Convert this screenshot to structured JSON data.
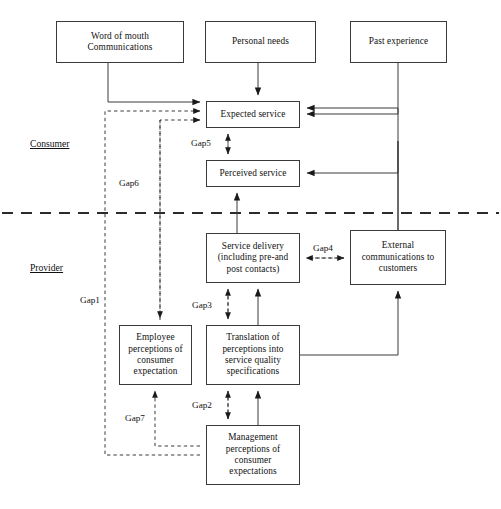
{
  "diagram": {
    "width": 501,
    "height": 509,
    "line_color": "#3a3a3a",
    "background": "#ffffff"
  },
  "zones": [
    {
      "id": "consumer",
      "label": "Consumer",
      "x": 30,
      "y": 138
    },
    {
      "id": "provider",
      "label": "Provider",
      "x": 30,
      "y": 262
    }
  ],
  "divider": {
    "name": "consumer-provider-divider",
    "style": "dashed",
    "y": 213,
    "x1": 2,
    "x2": 499
  },
  "nodes": [
    {
      "id": "word-of-mouth",
      "label": "Word of mouth\nCommunications",
      "x": 56,
      "y": 21,
      "w": 128,
      "h": 42
    },
    {
      "id": "personal-needs",
      "label": "Personal needs",
      "x": 205,
      "y": 21,
      "w": 111,
      "h": 42
    },
    {
      "id": "past-experience",
      "label": "Past experience",
      "x": 350,
      "y": 21,
      "w": 97,
      "h": 42
    },
    {
      "id": "expected-service",
      "label": "Expected service",
      "x": 206,
      "y": 101,
      "w": 94,
      "h": 27
    },
    {
      "id": "perceived-service",
      "label": "Perceived service",
      "x": 206,
      "y": 160,
      "w": 94,
      "h": 27
    },
    {
      "id": "service-delivery",
      "label": "Service delivery\n(including pre-and\npost contacts)",
      "x": 206,
      "y": 233,
      "w": 94,
      "h": 50
    },
    {
      "id": "external-communications",
      "label": "External\ncommunications to\ncustomers",
      "x": 350,
      "y": 230,
      "w": 96,
      "h": 55
    },
    {
      "id": "employee-perceptions",
      "label": "Employee\nperceptions of\nconsumer\nexpectation",
      "x": 119,
      "y": 325,
      "w": 73,
      "h": 60
    },
    {
      "id": "translation-of-perceptions",
      "label": "Translation of\nperceptions into\nservice quality\nspecifications",
      "x": 206,
      "y": 325,
      "w": 94,
      "h": 60
    },
    {
      "id": "management-perceptions",
      "label": "Management\nperceptions of\nconsumer\nexpectations",
      "x": 206,
      "y": 425,
      "w": 94,
      "h": 60
    }
  ],
  "gaps": [
    {
      "id": "gap1",
      "label": "Gap1",
      "x": 79,
      "y": 295
    },
    {
      "id": "gap2",
      "label": "Gap2",
      "x": 191,
      "y": 400
    },
    {
      "id": "gap3",
      "label": "Gap3",
      "x": 191,
      "y": 300
    },
    {
      "id": "gap4",
      "label": "Gap4",
      "x": 312,
      "y": 243
    },
    {
      "id": "gap5",
      "label": "Gap5",
      "x": 190,
      "y": 138
    },
    {
      "id": "gap6",
      "label": "Gap6",
      "x": 118,
      "y": 178
    },
    {
      "id": "gap7",
      "label": "Gap7",
      "x": 124,
      "y": 413
    }
  ],
  "connections": [
    {
      "id": "word-of-mouth-to-expected",
      "style": "solid",
      "from": "word-of-mouth",
      "to": "expected-service"
    },
    {
      "id": "personal-needs-to-expected",
      "style": "solid",
      "from": "personal-needs",
      "to": "expected-service"
    },
    {
      "id": "past-experience-to-expected",
      "style": "solid",
      "from": "past-experience",
      "to": "expected-service"
    },
    {
      "id": "gap1-to-expected",
      "style": "dashed",
      "from": "management-perceptions",
      "to": "expected-service"
    },
    {
      "id": "gap6-to-expected",
      "style": "dashed",
      "from": "employee-perceptions",
      "to": "expected-service"
    },
    {
      "id": "gap5-expected-perceived",
      "style": "dashed",
      "from": "expected-service",
      "to": "perceived-service"
    },
    {
      "id": "service-delivery-to-perceived",
      "style": "solid",
      "from": "service-delivery",
      "to": "perceived-service"
    },
    {
      "id": "external-comms-to-expected",
      "style": "solid",
      "from": "external-communications",
      "to": "expected-service"
    },
    {
      "id": "external-comms-to-perceived",
      "style": "solid",
      "from": "external-communications",
      "to": "perceived-service"
    },
    {
      "id": "gap4-delivery-external",
      "style": "dashed",
      "from": "service-delivery",
      "to": "external-communications"
    },
    {
      "id": "gap3-translation-delivery",
      "style": "dashed",
      "from": "translation-of-perceptions",
      "to": "service-delivery"
    },
    {
      "id": "translation-to-delivery",
      "style": "solid",
      "from": "translation-of-perceptions",
      "to": "service-delivery"
    },
    {
      "id": "gap2-management-translation",
      "style": "dashed",
      "from": "management-perceptions",
      "to": "translation-of-perceptions"
    },
    {
      "id": "management-to-translation",
      "style": "solid",
      "from": "management-perceptions",
      "to": "translation-of-perceptions"
    },
    {
      "id": "translation-to-external-comms",
      "style": "solid",
      "from": "translation-of-perceptions",
      "to": "external-communications"
    },
    {
      "id": "gap6-to-employee",
      "style": "dashed",
      "from": "expected-service",
      "to": "employee-perceptions"
    },
    {
      "id": "gap7-management-employee",
      "style": "dashed",
      "from": "management-perceptions",
      "to": "employee-perceptions"
    }
  ]
}
